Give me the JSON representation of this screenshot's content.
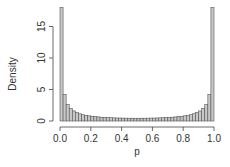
{
  "chart_data": {
    "type": "bar",
    "title": "",
    "xlabel": "p",
    "ylabel": "Density",
    "xlim": [
      0.0,
      1.0
    ],
    "ylim": [
      0,
      18
    ],
    "grid": false,
    "legend": null,
    "bin_width": 0.02,
    "x_ticks": [
      "0.0",
      "0.2",
      "0.4",
      "0.6",
      "0.8",
      "1.0"
    ],
    "y_ticks": [
      "0",
      "5",
      "10",
      "15"
    ],
    "bin_starts": [
      0.0,
      0.02,
      0.04,
      0.06,
      0.08,
      0.1,
      0.12,
      0.14,
      0.16,
      0.18,
      0.2,
      0.22,
      0.24,
      0.26,
      0.28,
      0.3,
      0.32,
      0.34,
      0.36,
      0.38,
      0.4,
      0.42,
      0.44,
      0.46,
      0.48,
      0.5,
      0.52,
      0.54,
      0.56,
      0.58,
      0.6,
      0.62,
      0.64,
      0.66,
      0.68,
      0.7,
      0.72,
      0.74,
      0.76,
      0.78,
      0.8,
      0.82,
      0.84,
      0.86,
      0.88,
      0.9,
      0.92,
      0.94,
      0.96,
      0.98
    ],
    "values": [
      18.0,
      4.2,
      2.6,
      2.0,
      1.6,
      1.35,
      1.15,
      1.0,
      0.9,
      0.82,
      0.75,
      0.7,
      0.65,
      0.6,
      0.57,
      0.55,
      0.52,
      0.5,
      0.48,
      0.47,
      0.46,
      0.45,
      0.44,
      0.44,
      0.43,
      0.43,
      0.44,
      0.44,
      0.45,
      0.46,
      0.47,
      0.48,
      0.5,
      0.52,
      0.55,
      0.57,
      0.6,
      0.65,
      0.7,
      0.75,
      0.82,
      0.9,
      1.0,
      1.15,
      1.35,
      1.6,
      2.0,
      2.6,
      4.2,
      18.0
    ]
  }
}
